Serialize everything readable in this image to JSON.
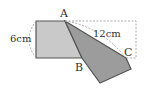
{
  "diagram": {
    "labels": {
      "point_a": "A",
      "point_b": "B",
      "point_c": "C",
      "side_length": "6cm",
      "diagonal_length": "12cm"
    },
    "colors": {
      "light_fill": "#c8c8c8",
      "dark_fill": "#9a9a9a",
      "stroke": "#444444",
      "dashed": "#999999"
    }
  }
}
